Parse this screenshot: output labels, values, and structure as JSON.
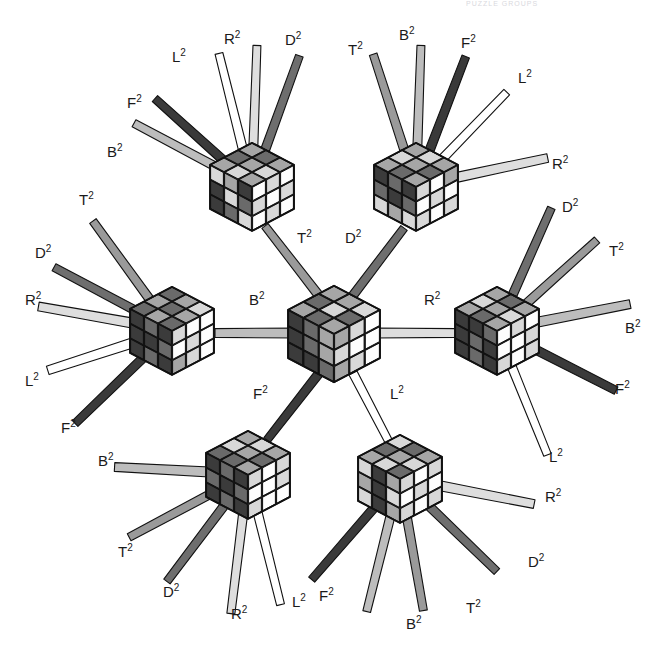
{
  "figure": {
    "cropped_header_text": "PUZZLE GROUPS",
    "background_color": "#ffffff",
    "label_color": "#1a1a1a",
    "cube_count": 7,
    "move_names": [
      "T2",
      "D2",
      "L2",
      "R2",
      "F2",
      "B2"
    ]
  },
  "move_colors": {
    "T2": "#9a9a9a",
    "D2": "#6e6e6e",
    "L2": "#ffffff",
    "R2": "#dedede",
    "F2": "#3a3a3a",
    "B2": "#bdbdbd"
  },
  "cube_palette": {
    "outline": "#111111",
    "tone_white": "#fdfdfd",
    "tone_light": "#d8d8d8",
    "tone_mid": "#a6a6a6",
    "tone_dark": "#6a6a6a",
    "tone_black": "#3b3b3b"
  },
  "cubes": [
    {
      "id": "cube-center",
      "name": "center-cube",
      "cx": 334,
      "cy": 333,
      "size": 46,
      "top_face": [
        "tone_mid",
        "tone_dark",
        "tone_mid",
        "tone_dark",
        "tone_light",
        "tone_mid",
        "tone_mid",
        "tone_dark",
        "tone_light"
      ],
      "left_face": [
        "tone_black",
        "tone_dark",
        "tone_mid",
        "tone_black",
        "tone_dark",
        "tone_mid",
        "tone_black",
        "tone_black",
        "tone_dark"
      ],
      "right_face": [
        "tone_mid",
        "tone_light",
        "tone_white",
        "tone_light",
        "tone_white",
        "tone_white",
        "tone_mid",
        "tone_light",
        "tone_white"
      ]
    },
    {
      "id": "cube-top-left",
      "name": "top-left-cube",
      "cx": 252,
      "cy": 186,
      "size": 42,
      "top_face": [
        "tone_mid",
        "tone_dark",
        "tone_mid",
        "tone_light",
        "tone_mid",
        "tone_dark",
        "tone_mid",
        "tone_light",
        "tone_mid"
      ],
      "left_face": [
        "tone_light",
        "tone_mid",
        "tone_black",
        "tone_black",
        "tone_light",
        "tone_dark",
        "tone_black",
        "tone_dark",
        "tone_light"
      ],
      "right_face": [
        "tone_white",
        "tone_light",
        "tone_white",
        "tone_light",
        "tone_white",
        "tone_light",
        "tone_white",
        "tone_light",
        "tone_white"
      ]
    },
    {
      "id": "cube-top-right",
      "name": "top-right-cube",
      "cx": 416,
      "cy": 186,
      "size": 42,
      "top_face": [
        "tone_mid",
        "tone_light",
        "tone_mid",
        "tone_dark",
        "tone_mid",
        "tone_light",
        "tone_mid",
        "tone_dark",
        "tone_mid"
      ],
      "left_face": [
        "tone_black",
        "tone_dark",
        "tone_black",
        "tone_dark",
        "tone_black",
        "tone_dark",
        "tone_light",
        "tone_mid",
        "tone_light"
      ],
      "right_face": [
        "tone_light",
        "tone_white",
        "tone_mid",
        "tone_white",
        "tone_light",
        "tone_white",
        "tone_light",
        "tone_white",
        "tone_light"
      ]
    },
    {
      "id": "cube-left",
      "name": "left-cube",
      "cx": 172,
      "cy": 330,
      "size": 42,
      "top_face": [
        "tone_dark",
        "tone_mid",
        "tone_dark",
        "tone_mid",
        "tone_dark",
        "tone_mid",
        "tone_dark",
        "tone_mid",
        "tone_light"
      ],
      "left_face": [
        "tone_black",
        "tone_dark",
        "tone_black",
        "tone_black",
        "tone_black",
        "tone_dark",
        "tone_black",
        "tone_dark",
        "tone_black"
      ],
      "right_face": [
        "tone_light",
        "tone_white",
        "tone_white",
        "tone_white",
        "tone_light",
        "tone_white",
        "tone_mid",
        "tone_light",
        "tone_white"
      ]
    },
    {
      "id": "cube-right",
      "name": "right-cube",
      "cx": 497,
      "cy": 330,
      "size": 42,
      "top_face": [
        "tone_mid",
        "tone_light",
        "tone_mid",
        "tone_dark",
        "tone_mid",
        "tone_dark",
        "tone_mid",
        "tone_light",
        "tone_mid"
      ],
      "left_face": [
        "tone_black",
        "tone_black",
        "tone_dark",
        "tone_black",
        "tone_dark",
        "tone_black",
        "tone_black",
        "tone_dark",
        "tone_black"
      ],
      "right_face": [
        "tone_white",
        "tone_light",
        "tone_white",
        "tone_white",
        "tone_white",
        "tone_light",
        "tone_light",
        "tone_white",
        "tone_light"
      ]
    },
    {
      "id": "cube-bottom-left",
      "name": "bottom-left-cube",
      "cx": 248,
      "cy": 474,
      "size": 42,
      "top_face": [
        "tone_dark",
        "tone_light",
        "tone_mid",
        "tone_dark",
        "tone_mid",
        "tone_light",
        "tone_mid",
        "tone_dark",
        "tone_mid"
      ],
      "left_face": [
        "tone_black",
        "tone_dark",
        "tone_black",
        "tone_dark",
        "tone_black",
        "tone_dark",
        "tone_black",
        "tone_dark",
        "tone_black"
      ],
      "right_face": [
        "tone_light",
        "tone_white",
        "tone_light",
        "tone_white",
        "tone_white",
        "tone_light",
        "tone_light",
        "tone_white",
        "tone_white"
      ]
    },
    {
      "id": "cube-bottom-right",
      "name": "bottom-right-cube",
      "cx": 400,
      "cy": 478,
      "size": 42,
      "top_face": [
        "tone_mid",
        "tone_dark",
        "tone_light",
        "tone_light",
        "tone_mid",
        "tone_dark",
        "tone_dark",
        "tone_light",
        "tone_mid"
      ],
      "left_face": [
        "tone_light",
        "tone_black",
        "tone_mid",
        "tone_mid",
        "tone_black",
        "tone_light",
        "tone_light",
        "tone_black",
        "tone_mid"
      ],
      "right_face": [
        "tone_light",
        "tone_white",
        "tone_light",
        "tone_white",
        "tone_light",
        "tone_white",
        "tone_light",
        "tone_white",
        "tone_light"
      ]
    }
  ],
  "edges": [
    {
      "name": "edge-center-top-left",
      "move": "T2",
      "from": "cube-center",
      "to": "cube-top-left",
      "label_x": 297,
      "label_y": 243,
      "x1": 320,
      "y1": 297,
      "x2": 265,
      "y2": 226,
      "w": 9
    },
    {
      "name": "edge-center-top-right",
      "move": "D2",
      "from": "cube-center",
      "to": "cube-top-right",
      "label_x": 345,
      "label_y": 243,
      "x1": 351,
      "y1": 298,
      "x2": 404,
      "y2": 228,
      "w": 9
    },
    {
      "name": "edge-center-left",
      "move": "B2",
      "from": "cube-center",
      "to": "cube-left",
      "label_x": 249,
      "label_y": 305,
      "x1": 297,
      "y1": 333,
      "x2": 215,
      "y2": 333,
      "w": 10
    },
    {
      "name": "edge-center-right",
      "move": "R2",
      "from": "cube-center",
      "to": "cube-right",
      "label_x": 424,
      "label_y": 305,
      "x1": 374,
      "y1": 333,
      "x2": 456,
      "y2": 333,
      "w": 10
    },
    {
      "name": "edge-center-bottom-left",
      "move": "F2",
      "from": "cube-center",
      "to": "cube-bottom-left",
      "label_x": 253,
      "label_y": 399,
      "x1": 320,
      "y1": 372,
      "x2": 267,
      "y2": 440,
      "w": 9
    },
    {
      "name": "edge-center-bottom-right",
      "move": "L2",
      "from": "cube-center",
      "to": "cube-bottom-right",
      "label_x": 390,
      "label_y": 399,
      "x1": 353,
      "y1": 373,
      "x2": 389,
      "y2": 442,
      "w": 9
    }
  ],
  "spokes": [
    {
      "name": "spoke-top-left-B2",
      "cube": "cube-top-left",
      "move": "B2",
      "angle": 208,
      "len": 95,
      "w": 9,
      "label": "B2",
      "label_x": 107,
      "label_y": 157
    },
    {
      "name": "spoke-top-left-F2",
      "cube": "cube-top-left",
      "move": "F2",
      "angle": 222,
      "len": 92,
      "w": 9,
      "label": "F2",
      "label_x": 127,
      "label_y": 108
    },
    {
      "name": "spoke-top-left-L2",
      "cube": "cube-top-left",
      "move": "L2",
      "angle": 256,
      "len": 98,
      "w": 9,
      "label": "L2",
      "label_x": 172,
      "label_y": 62
    },
    {
      "name": "spoke-top-left-R2",
      "cube": "cube-top-left",
      "move": "R2",
      "angle": 272,
      "len": 102,
      "w": 9,
      "label": "R2",
      "label_x": 224,
      "label_y": 44
    },
    {
      "name": "spoke-top-left-D2",
      "cube": "cube-top-left",
      "move": "D2",
      "angle": 290,
      "len": 100,
      "w": 9,
      "label": "D2",
      "label_x": 285,
      "label_y": 45
    },
    {
      "name": "spoke-top-right-T2",
      "cube": "cube-top-right",
      "move": "T2",
      "angle": 252,
      "len": 100,
      "w": 9,
      "label": "T2",
      "label_x": 348,
      "label_y": 55
    },
    {
      "name": "spoke-top-right-B2",
      "cube": "cube-top-right",
      "move": "B2",
      "angle": 272,
      "len": 102,
      "w": 9,
      "label": "B2",
      "label_x": 399,
      "label_y": 40
    },
    {
      "name": "spoke-top-right-F2",
      "cube": "cube-top-right",
      "move": "F2",
      "angle": 291,
      "len": 100,
      "w": 9,
      "label": "F2",
      "label_x": 461,
      "label_y": 48
    },
    {
      "name": "spoke-top-right-L2",
      "cube": "cube-top-right",
      "move": "L2",
      "angle": 314,
      "len": 92,
      "w": 9,
      "label": "L2",
      "label_x": 518,
      "label_y": 83
    },
    {
      "name": "spoke-top-right-R2",
      "cube": "cube-top-right",
      "move": "R2",
      "angle": 348,
      "len": 96,
      "w": 10,
      "label": "R2",
      "label_x": 552,
      "label_y": 169
    },
    {
      "name": "spoke-left-T2",
      "cube": "cube-left",
      "move": "T2",
      "angle": 234,
      "len": 96,
      "w": 9,
      "label": "T2",
      "label_x": 79,
      "label_y": 205
    },
    {
      "name": "spoke-left-D2",
      "cube": "cube-left",
      "move": "D2",
      "angle": 208,
      "len": 95,
      "w": 9,
      "label": "D2",
      "label_x": 35,
      "label_y": 258
    },
    {
      "name": "spoke-left-R2",
      "cube": "cube-left",
      "move": "R2",
      "angle": 190,
      "len": 97,
      "w": 10,
      "label": "R2",
      "label_x": 25,
      "label_y": 305
    },
    {
      "name": "spoke-left-L2",
      "cube": "cube-left",
      "move": "L2",
      "angle": 162,
      "len": 92,
      "w": 10,
      "label": "L2",
      "label_x": 25,
      "label_y": 386
    },
    {
      "name": "spoke-left-F2",
      "cube": "cube-left",
      "move": "F2",
      "angle": 136,
      "len": 96,
      "w": 9,
      "label": "F2",
      "label_x": 61,
      "label_y": 433
    },
    {
      "name": "spoke-right-D2",
      "cube": "cube-right",
      "move": "D2",
      "angle": 294,
      "len": 95,
      "w": 9,
      "label": "D2",
      "label_x": 562,
      "label_y": 212
    },
    {
      "name": "spoke-right-T2",
      "cube": "cube-right",
      "move": "T2",
      "angle": 318,
      "len": 96,
      "w": 9,
      "label": "T2",
      "label_x": 609,
      "label_y": 256
    },
    {
      "name": "spoke-right-B2",
      "cube": "cube-right",
      "move": "B2",
      "angle": 349,
      "len": 97,
      "w": 10,
      "label": "B2",
      "label_x": 625,
      "label_y": 333
    },
    {
      "name": "spoke-right-F2",
      "cube": "cube-right",
      "move": "F2",
      "angle": 27,
      "len": 95,
      "w": 9,
      "label": "F2",
      "label_x": 615,
      "label_y": 394
    },
    {
      "name": "spoke-right-L2",
      "cube": "cube-right",
      "move": "L2",
      "angle": 68,
      "len": 96,
      "w": 9,
      "label": "L2",
      "label_x": 549,
      "label_y": 462
    },
    {
      "name": "spoke-bottom-left-B2",
      "cube": "cube-bottom-left",
      "move": "B2",
      "angle": 183,
      "len": 95,
      "w": 10,
      "label": "B2",
      "label_x": 98,
      "label_y": 466
    },
    {
      "name": "spoke-bottom-left-T2",
      "cube": "cube-bottom-left",
      "move": "T2",
      "angle": 152,
      "len": 96,
      "w": 9,
      "label": "T2",
      "label_x": 118,
      "label_y": 557
    },
    {
      "name": "spoke-bottom-left-D2",
      "cube": "cube-bottom-left",
      "move": "D2",
      "angle": 127,
      "len": 96,
      "w": 9,
      "label": "D2",
      "label_x": 163,
      "label_y": 597
    },
    {
      "name": "spoke-bottom-left-R2",
      "cube": "cube-bottom-left",
      "move": "R2",
      "angle": 97,
      "len": 102,
      "w": 9,
      "label": "R2",
      "label_x": 231,
      "label_y": 619
    },
    {
      "name": "spoke-bottom-left-L2",
      "cube": "cube-bottom-left",
      "move": "L2",
      "angle": 76,
      "len": 96,
      "w": 9,
      "label": "L2",
      "label_x": 292,
      "label_y": 607
    },
    {
      "name": "spoke-bottom-right-F2",
      "cube": "cube-bottom-right",
      "move": "F2",
      "angle": 131,
      "len": 96,
      "w": 9,
      "label": "F2",
      "label_x": 319,
      "label_y": 601
    },
    {
      "name": "spoke-bottom-right-B2",
      "cube": "cube-bottom-right",
      "move": "B2",
      "angle": 104,
      "len": 99,
      "w": 9,
      "label": "B2",
      "label_x": 406,
      "label_y": 629
    },
    {
      "name": "spoke-bottom-right-T2",
      "cube": "cube-bottom-right",
      "move": "T2",
      "angle": 80,
      "len": 96,
      "w": 9,
      "label": "T2",
      "label_x": 466,
      "label_y": 613
    },
    {
      "name": "spoke-bottom-right-D2",
      "cube": "cube-bottom-right",
      "move": "D2",
      "angle": 44,
      "len": 96,
      "w": 9,
      "label": "D2",
      "label_x": 528,
      "label_y": 567
    },
    {
      "name": "spoke-bottom-right-R2",
      "cube": "cube-bottom-right",
      "move": "R2",
      "angle": 11,
      "len": 98,
      "w": 10,
      "label": "R2",
      "label_x": 545,
      "label_y": 502
    }
  ]
}
